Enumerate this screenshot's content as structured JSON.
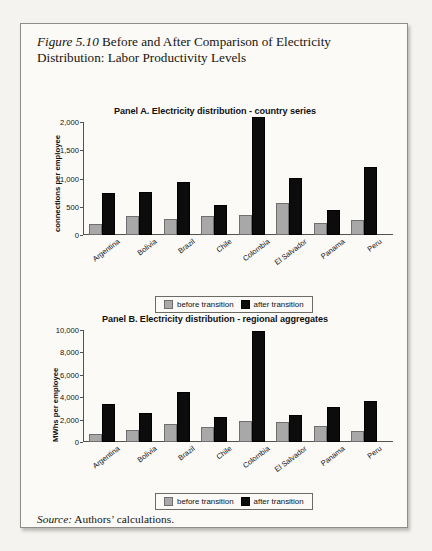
{
  "figure": {
    "number": "Figure 5.10",
    "caption": " Before and After Comparison of Electricity Distribution: Labor Productivity Levels"
  },
  "source": {
    "label": "Source:",
    "text": " Authors’ calculations."
  },
  "legend": {
    "before_label": "before transition",
    "after_label": "after transition",
    "before_color": "#a8a8a8",
    "after_color": "#0c0c0c"
  },
  "chart_data": [
    {
      "type": "bar",
      "panel": "A",
      "title": "Panel A. Electricity distribution - country series",
      "xlabel": "",
      "ylabel": "connections per employee",
      "ylim": [
        0,
        2000
      ],
      "yticks": [
        "0",
        "500",
        "1,000",
        "1,500",
        "2,000"
      ],
      "ytick_values": [
        0,
        500,
        1000,
        1500,
        2000
      ],
      "grid": false,
      "legend_position": "bottom",
      "categories": [
        "Argentina",
        "Bolivia",
        "Brazil",
        "Chile",
        "Colombia",
        "El Salvador",
        "Panama",
        "Peru"
      ],
      "series": [
        {
          "name": "before transition",
          "values": [
            200,
            330,
            290,
            340,
            360,
            570,
            210,
            270
          ]
        },
        {
          "name": "after transition",
          "values": [
            740,
            770,
            940,
            540,
            2080,
            1010,
            440,
            1210
          ]
        }
      ]
    },
    {
      "type": "bar",
      "panel": "B",
      "title": "Panel B. Electricity distribution - regional aggregates",
      "xlabel": "",
      "ylabel": "MWhs per employee",
      "ylim": [
        0,
        10000
      ],
      "yticks": [
        "0",
        "2,000",
        "4,000",
        "6,000",
        "8,000",
        "10,000"
      ],
      "ytick_values": [
        0,
        2000,
        4000,
        6000,
        8000,
        10000
      ],
      "grid": false,
      "legend_position": "bottom",
      "categories": [
        "Argentina",
        "Bolivia",
        "Brazil",
        "Chile",
        "Colombia",
        "El Salvador",
        "Panama",
        "Peru"
      ],
      "series": [
        {
          "name": "before transition",
          "values": [
            700,
            1100,
            1600,
            1300,
            1850,
            1750,
            1400,
            1000
          ]
        },
        {
          "name": "after transition",
          "values": [
            3400,
            2550,
            4500,
            2200,
            9900,
            2450,
            3100,
            3650
          ]
        }
      ]
    }
  ]
}
